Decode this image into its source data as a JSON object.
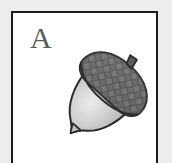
{
  "card": {
    "letter": "A",
    "illustration_name": "acorn",
    "illustration_alt": "acorn",
    "frame_color": "#1c1c1c",
    "card_background": "#ffffff",
    "page_background": "#ededed",
    "letter_color": "#5a5a5a"
  },
  "illustration": {
    "name": "acorn",
    "parts": [
      {
        "name": "acorn-stem",
        "color": "#5c5c5c"
      },
      {
        "name": "acorn-cap",
        "color": "#6a6a6a",
        "texture": "diamond-scales"
      },
      {
        "name": "acorn-nut",
        "color": "#c8c8c8",
        "highlight": "#e6e6e6"
      },
      {
        "name": "acorn-tip",
        "color": "#bdbdbd"
      }
    ],
    "outline_color": "#2b2b2b"
  }
}
